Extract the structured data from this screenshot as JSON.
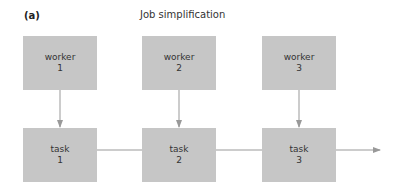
{
  "panel_label": "(a)",
  "title": "Job simplification",
  "colors": {
    "box_fill": "#c6c6c6",
    "connector": "#999999",
    "text": "#333333"
  },
  "workers": [
    {
      "label": "worker",
      "number": "1"
    },
    {
      "label": "worker",
      "number": "2"
    },
    {
      "label": "worker",
      "number": "3"
    }
  ],
  "tasks": [
    {
      "label": "task",
      "number": "1"
    },
    {
      "label": "task",
      "number": "2"
    },
    {
      "label": "task",
      "number": "3"
    }
  ]
}
